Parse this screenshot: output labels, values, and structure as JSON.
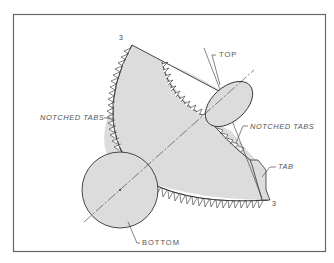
{
  "diagram": {
    "labels": {
      "notched_tabs_left": "NOTCHED TABS",
      "notched_tabs_right": "NOTCHED TABS",
      "top": "TOP",
      "bottom": "BOTTOM",
      "tab": "TAB",
      "mark_top": "3",
      "mark_bottom": "3"
    },
    "colors": {
      "fill": "#d9d9d9",
      "stroke": "#333333",
      "frame": "#666666"
    }
  }
}
